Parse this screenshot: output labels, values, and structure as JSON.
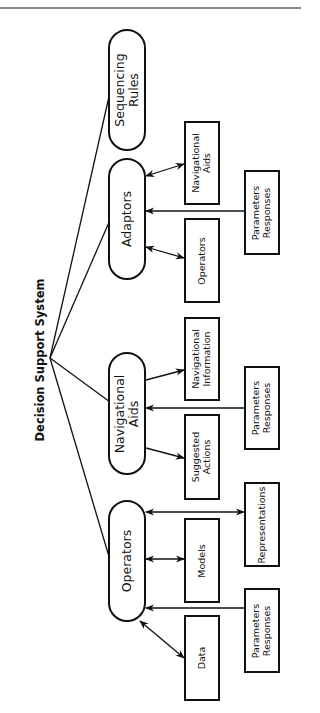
{
  "diagram": {
    "title": "Decision Support System",
    "orientation": "rotated -90deg",
    "colors": {
      "stroke": "#111111",
      "background": "#ffffff",
      "top_rule": "#8a8a8a"
    },
    "branches": [
      {
        "id": "operators",
        "label": "Operators",
        "children": [
          {
            "id": "data",
            "label": "Data",
            "link": "bidirectional"
          },
          {
            "id": "models",
            "label": "Models",
            "link": "bidirectional"
          },
          {
            "id": "representations",
            "label": "Representations",
            "link": "bidirectional"
          },
          {
            "id": "operators-params",
            "label": "Parameters\nResponses",
            "link": "input"
          }
        ]
      },
      {
        "id": "navigational-aids",
        "label": "Navigational\nAids",
        "children": [
          {
            "id": "suggested-actions",
            "label": "Suggested\nActions",
            "link": "output"
          },
          {
            "id": "navigational-information",
            "label": "Navigational\nInformation",
            "link": "output"
          },
          {
            "id": "navaids-params",
            "label": "Parameters\nResponses",
            "link": "input"
          }
        ]
      },
      {
        "id": "adaptors",
        "label": "Adaptors",
        "children": [
          {
            "id": "adaptors-operators",
            "label": "Operators",
            "link": "bidirectional"
          },
          {
            "id": "adaptors-navaids",
            "label": "Navigational\nAids",
            "link": "bidirectional"
          },
          {
            "id": "adaptors-params",
            "label": "Parameters\nResponses",
            "link": "input"
          }
        ]
      },
      {
        "id": "sequencing-rules",
        "label": "Sequencing\nRules",
        "children": []
      }
    ]
  }
}
